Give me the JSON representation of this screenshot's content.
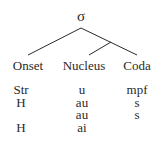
{
  "root": {
    "label": "σ"
  },
  "constituents": [
    {
      "label": "Onset"
    },
    {
      "label": "Nucleus"
    },
    {
      "label": "Coda"
    }
  ],
  "rows": [
    {
      "onset": "Str",
      "nucleus": "u",
      "coda": "mpf"
    },
    {
      "onset": "H",
      "nucleus": "au",
      "coda": "s"
    },
    {
      "onset": "",
      "nucleus": "au",
      "coda": "s"
    },
    {
      "onset": "H",
      "nucleus": "ai",
      "coda": ""
    }
  ],
  "colors": {
    "line": "#2a2a2a",
    "text": "#2a2a2a"
  }
}
